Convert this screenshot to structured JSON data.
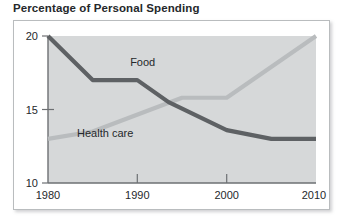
{
  "chart_data": {
    "type": "line",
    "title": "Percentage of Personal Spending",
    "xlabel": "",
    "ylabel": "",
    "xlim": [
      1980,
      2010
    ],
    "ylim": [
      10,
      20
    ],
    "grid": false,
    "legend_position": "inline-annotations",
    "y_ticks": [
      "20",
      "15",
      "10"
    ],
    "y_tick_values": [
      20,
      15,
      10
    ],
    "x_ticks": [
      "1980",
      "1990",
      "2000",
      "2010"
    ],
    "x_tick_values": [
      1980,
      1990,
      2000,
      2010
    ],
    "series": [
      {
        "name": "Food",
        "color": "#5e6164",
        "x": [
          1980,
          1985,
          1990,
          1993.5,
          2000,
          2005,
          2010
        ],
        "values": [
          20.0,
          17.0,
          17.0,
          15.5,
          13.6,
          13.0,
          13.0
        ]
      },
      {
        "name": "Health care",
        "color": "#b9bcbe",
        "x": [
          1980,
          1985,
          1995,
          2000,
          2010
        ],
        "values": [
          13.0,
          13.5,
          15.8,
          15.8,
          20.0
        ]
      }
    ],
    "annotations": [
      {
        "text": "Food",
        "x": 1990.6,
        "y": 17.95
      },
      {
        "text": "Health care",
        "x": 1986.4,
        "y": 13.15
      }
    ]
  },
  "colors": {
    "plot_background": "#d6d8d9",
    "frame_border": "#b9bcbe",
    "axis_line": "#6d7073",
    "text": "#25282b",
    "food_line": "#5e6164",
    "health_line": "#b9bcbe"
  },
  "labels": {
    "y_20": "20",
    "y_15": "15",
    "y_10": "10",
    "x_1980": "1980",
    "x_1990": "1990",
    "x_2000": "2000",
    "x_2010": "2010",
    "food": "Food",
    "health_care": "Health care"
  }
}
